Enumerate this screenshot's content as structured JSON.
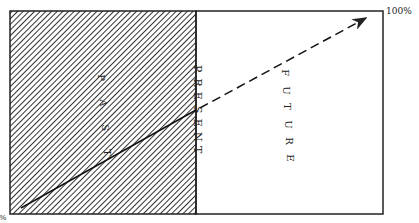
{
  "diagram": {
    "regions": {
      "past": {
        "label": "PAST",
        "letters": [
          "P",
          "A",
          "S",
          "T"
        ],
        "fill": "hatched"
      },
      "present": {
        "label": "PRESENT",
        "letters": [
          "P",
          "R",
          "E",
          "S",
          "E",
          "N",
          "T"
        ]
      },
      "future": {
        "label": "FUTURE",
        "letters": [
          "F",
          "U",
          "T",
          "U",
          "R",
          "E"
        ],
        "fill": "#ffffff"
      }
    },
    "axis_labels": {
      "start": "0%",
      "end": "100%"
    },
    "lines": {
      "past_line": "solid",
      "future_line": "dashed-arrow"
    },
    "colors": {
      "stroke": "#222222",
      "background": "#ffffff"
    }
  }
}
